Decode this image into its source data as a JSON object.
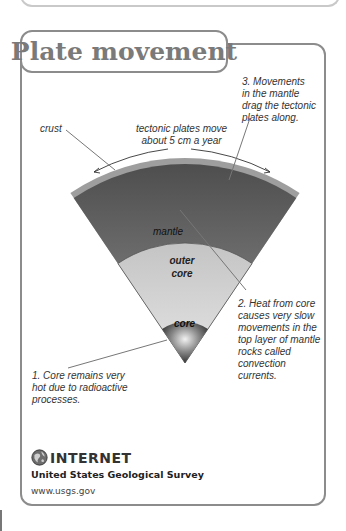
{
  "title": "Plate movement",
  "labels": {
    "crust": "crust",
    "plates_move": [
      "tectonic plates move",
      "about 5 cm a year"
    ],
    "mantle": "mantle",
    "outer_core": [
      "outer",
      "core"
    ],
    "core": "core"
  },
  "steps": [
    {
      "lines": [
        "1. Core remains very",
        "hot due to radioactive",
        "processes."
      ]
    },
    {
      "lines": [
        "2. Heat from core",
        "causes very slow",
        "movements in the",
        "top layer of mantle",
        "rocks called",
        "convection",
        "currents."
      ]
    },
    {
      "lines": [
        "3. Movements",
        "in the mantle",
        "drag the tectonic",
        "plates along."
      ]
    }
  ],
  "footer": {
    "icon": "globe-icon",
    "heading": "INTERNET",
    "organization": "United States Geological Survey",
    "url": "www.usgs.gov"
  },
  "colors": {
    "border": "#8c8c8c",
    "title": "#7a7a7a",
    "crust": "#9a9a9a",
    "mantle_dark": "#555555",
    "mantle_light": "#8a8a8a",
    "outer_core": "#d0d0d0",
    "core_dark": "#3a3a3a"
  }
}
